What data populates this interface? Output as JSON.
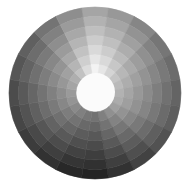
{
  "figure": {
    "title": "Grayscale value wheel",
    "background": "#ffffff",
    "center": {
      "x": 95,
      "y": 93
    },
    "outer_radius": 86,
    "inner_radius": 19,
    "inner_fill": "#fbfbfb",
    "rings": 7,
    "ring_lightening": 13,
    "sectors": [
      165,
      152,
      134,
      118,
      108,
      100,
      94,
      82,
      66,
      50,
      36,
      40,
      50,
      60,
      70,
      76,
      86,
      96,
      116,
      142
    ]
  }
}
